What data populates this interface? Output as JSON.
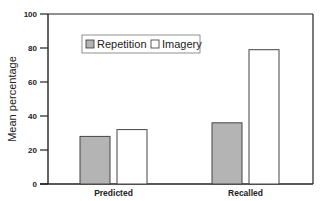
{
  "chart_data": {
    "type": "bar",
    "title": "",
    "xlabel": "",
    "ylabel": "Mean percentage",
    "ylim": [
      0,
      100
    ],
    "yticks": [
      0,
      20,
      40,
      60,
      80,
      100
    ],
    "categories": [
      "Predicted",
      "Recalled"
    ],
    "series": [
      {
        "name": "Repetition",
        "values": [
          28,
          36
        ],
        "color": "#b4b4b4"
      },
      {
        "name": "Imagery",
        "values": [
          32,
          79
        ],
        "color": "#ffffff"
      }
    ],
    "legend_position": "upper-left-inside",
    "grid": false
  }
}
